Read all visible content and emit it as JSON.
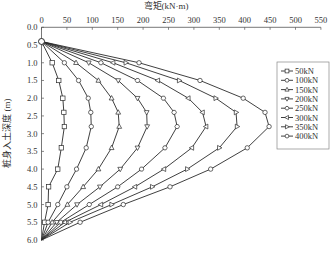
{
  "chart_data": {
    "type": "line",
    "title": "",
    "xlabel": "弯矩(kN·m)",
    "ylabel": "桩身入土深度 (m)",
    "x_axis_position": "top",
    "y_axis_inverted": true,
    "xlim": [
      0,
      550
    ],
    "ylim": [
      0.0,
      6.0
    ],
    "x_ticks": [
      0,
      50,
      100,
      150,
      200,
      250,
      300,
      350,
      400,
      450,
      500,
      550
    ],
    "y_ticks": [
      "0.0",
      "0.5",
      "1.0",
      "1.5",
      "2.0",
      "2.5",
      "3.0",
      "3.5",
      "4.0",
      "4.5",
      "5.0",
      "5.5",
      "6.0"
    ],
    "grid": false,
    "legend_position": "right",
    "depth": [
      0.4,
      1.0,
      1.5,
      2.0,
      2.4,
      2.8,
      3.4,
      4.0,
      4.5,
      5.0,
      5.5,
      6.0
    ],
    "series": [
      {
        "name": "50kN",
        "marker": "square",
        "values": [
          0,
          21,
          34,
          42,
          44,
          45,
          39,
          32,
          14,
          13,
          6,
          0
        ]
      },
      {
        "name": "100kN",
        "marker": "circle",
        "values": [
          0,
          45,
          73,
          92,
          97,
          98,
          88,
          69,
          50,
          32,
          13,
          0
        ]
      },
      {
        "name": "150kN",
        "marker": "triangle-up",
        "values": [
          0,
          68,
          112,
          138,
          151,
          153,
          138,
          112,
          82,
          51,
          21,
          0
        ]
      },
      {
        "name": "200kN",
        "marker": "triangle-down",
        "values": [
          0,
          93,
          151,
          189,
          207,
          208,
          189,
          155,
          115,
          70,
          30,
          0
        ]
      },
      {
        "name": "250kN",
        "marker": "hexagon",
        "values": [
          0,
          117,
          189,
          240,
          261,
          267,
          243,
          197,
          150,
          94,
          38,
          0
        ]
      },
      {
        "name": "300kN",
        "marker": "triangle-left",
        "values": [
          0,
          141,
          229,
          289,
          317,
          324,
          296,
          241,
          184,
          117,
          46,
          0
        ]
      },
      {
        "name": "350kN",
        "marker": "triangle-right",
        "values": [
          0,
          166,
          271,
          343,
          383,
          385,
          350,
          287,
          218,
          138,
          56,
          0
        ]
      },
      {
        "name": "400kN",
        "marker": "circle",
        "values": [
          0,
          192,
          312,
          397,
          440,
          448,
          405,
          333,
          253,
          161,
          76,
          0
        ]
      }
    ]
  },
  "colors": {
    "line": "#2a2a2a",
    "axis": "#555555",
    "marker_fill": "#ffffff",
    "legend_border": "#888888"
  }
}
